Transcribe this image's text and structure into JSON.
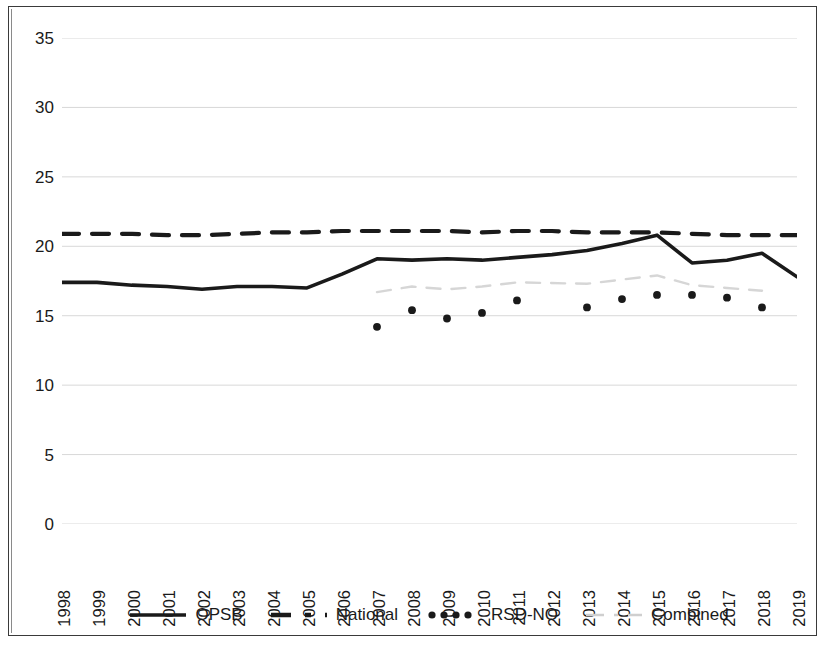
{
  "chart_data": {
    "type": "line",
    "title": "",
    "subtitle": "",
    "xlabel": "",
    "ylabel": "",
    "xlim": [
      1998,
      2019
    ],
    "ylim": [
      0,
      35
    ],
    "ytick_interval": 5,
    "grid": true,
    "grid_axis": "y",
    "legend_position": "bottom",
    "categories": [
      1998,
      1999,
      2000,
      2001,
      2002,
      2003,
      2004,
      2005,
      2006,
      2007,
      2008,
      2009,
      2010,
      2011,
      2012,
      2013,
      2014,
      2015,
      2016,
      2017,
      2018,
      2019
    ],
    "xticks": [
      "1998",
      "1999",
      "2000",
      "2001",
      "2002",
      "2003",
      "2004",
      "2005",
      "2006",
      "2007",
      "2008",
      "2009",
      "2010",
      "2011",
      "2012",
      "2013",
      "2014",
      "2015",
      "2016",
      "2017",
      "2018",
      "2019"
    ],
    "yticks": [
      "0",
      "5",
      "10",
      "15",
      "20",
      "25",
      "30",
      "35"
    ],
    "series": [
      {
        "name": "OPSB",
        "style": "solid",
        "color": "#1a1a1a",
        "x": [
          1998,
          1999,
          2000,
          2001,
          2002,
          2003,
          2004,
          2005,
          2006,
          2007,
          2008,
          2009,
          2010,
          2011,
          2012,
          2013,
          2014,
          2015,
          2016,
          2017,
          2018,
          2019
        ],
        "values": [
          17.4,
          17.4,
          17.2,
          17.1,
          16.9,
          17.1,
          17.1,
          17.0,
          18.0,
          19.1,
          19.0,
          19.1,
          19.0,
          19.2,
          19.4,
          19.7,
          20.2,
          20.8,
          18.8,
          19.0,
          19.5,
          17.8
        ]
      },
      {
        "name": "National",
        "style": "dashed",
        "color": "#1a1a1a",
        "x": [
          1998,
          1999,
          2000,
          2001,
          2002,
          2003,
          2004,
          2005,
          2006,
          2007,
          2008,
          2009,
          2010,
          2011,
          2012,
          2013,
          2014,
          2015,
          2016,
          2017,
          2018,
          2019
        ],
        "values": [
          20.9,
          20.9,
          20.9,
          20.8,
          20.8,
          20.9,
          21.0,
          21.0,
          21.1,
          21.1,
          21.1,
          21.1,
          21.0,
          21.1,
          21.1,
          21.0,
          21.0,
          21.0,
          20.9,
          20.8,
          20.8,
          20.8
        ]
      },
      {
        "name": "RSD-NO",
        "style": "dotted",
        "color": "#1a1a1a",
        "x": [
          2007,
          2008,
          2009,
          2010,
          2011,
          2013,
          2014,
          2015,
          2016,
          2017,
          2018
        ],
        "values": [
          14.2,
          15.4,
          14.8,
          15.2,
          16.1,
          15.6,
          16.2,
          16.5,
          16.5,
          16.3,
          15.6
        ]
      },
      {
        "name": "Combined",
        "style": "faint",
        "color": "#cfcfcf",
        "x": [
          2007,
          2008,
          2009,
          2010,
          2011,
          2013,
          2014,
          2015,
          2016,
          2017,
          2018
        ],
        "values": [
          16.7,
          17.1,
          16.9,
          17.1,
          17.4,
          17.3,
          17.6,
          17.9,
          17.2,
          17.0,
          16.8
        ]
      }
    ]
  },
  "legend": {
    "items": [
      {
        "label": "OPSB",
        "style": "solid"
      },
      {
        "label": "National",
        "style": "dashed"
      },
      {
        "label": "RSD-NO",
        "style": "dotted"
      },
      {
        "label": "Combined",
        "style": "faint"
      }
    ]
  }
}
